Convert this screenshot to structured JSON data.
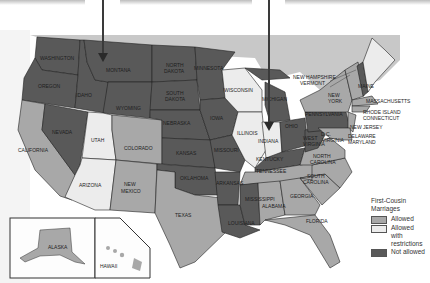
{
  "map": {
    "title": "First-Cousin Marriages",
    "colors": {
      "allowed": "#a8a8a8",
      "restricted": "#ececec",
      "not_allowed": "#595959",
      "canada": "#c8c8c8",
      "water": "#ffffff"
    },
    "legend": {
      "title": "First-Cousin Marriages",
      "items": [
        {
          "label": "Allowed",
          "sub": "",
          "key": "allowed"
        },
        {
          "label": "Allowed",
          "sub": "with restrictions",
          "key": "restricted"
        },
        {
          "label": "Not allowed",
          "sub": "",
          "key": "not_allowed"
        }
      ]
    },
    "states": {
      "washington": "WASHINGTON",
      "oregon": "OREGON",
      "idaho": "IDAHO",
      "montana": "MONTANA",
      "wyoming": "WYOMING",
      "nevada": "NEVADA",
      "california": "CALIFORNIA",
      "utah": "UTAH",
      "colorado": "COLORADO",
      "arizona": "ARIZONA",
      "new_mexico": [
        "NEW",
        "MEXICO"
      ],
      "north_dakota": [
        "NORTH",
        "DAKOTA"
      ],
      "south_dakota": [
        "SOUTH",
        "DAKOTA"
      ],
      "nebraska": "NEBRASKA",
      "kansas": "KANSAS",
      "oklahoma": "OKLAHOMA",
      "texas": "TEXAS",
      "minnesota": "MINNESOTA",
      "iowa": "IOWA",
      "missouri": "MISSOURI",
      "arkansas": "ARKANSAS",
      "louisiana": "LOUISIANA",
      "wisconsin": "WISCONSIN",
      "illinois": "ILLINOIS",
      "michigan": "MICHIGAN",
      "indiana": "INDIANA",
      "ohio": "OHIO",
      "kentucky": "KENTUCKY",
      "tennessee": "TENNESSEE",
      "mississippi": "MISSISSIPPI",
      "alabama": "ALABAMA",
      "georgia": "GEORGIA",
      "florida": "FLORIDA",
      "south_carolina": [
        "SOUTH",
        "CAROLINA"
      ],
      "north_carolina": [
        "NORTH",
        "CAROLINA"
      ],
      "virginia": "VIRGINIA",
      "west_virginia": [
        "WEST",
        "VIRGINIA"
      ],
      "pennsylvania": "PENNSYLVANIA",
      "new_york": [
        "NEW",
        "YORK"
      ],
      "new_jersey": "NEW JERSEY",
      "delaware_maryland": [
        "DELAWARE",
        "MARYLAND"
      ],
      "dc": "D.C.",
      "ri_ct": [
        "RHODE ISLAND",
        "CONNECTICUT"
      ],
      "massachusetts": "MASSACHUSETTS",
      "nh_vt": [
        "NEW HAMPSHIRE",
        "VERMONT"
      ],
      "maine": "MAINE",
      "alaska": "ALASKA",
      "hawaii": "HAWAII"
    }
  }
}
